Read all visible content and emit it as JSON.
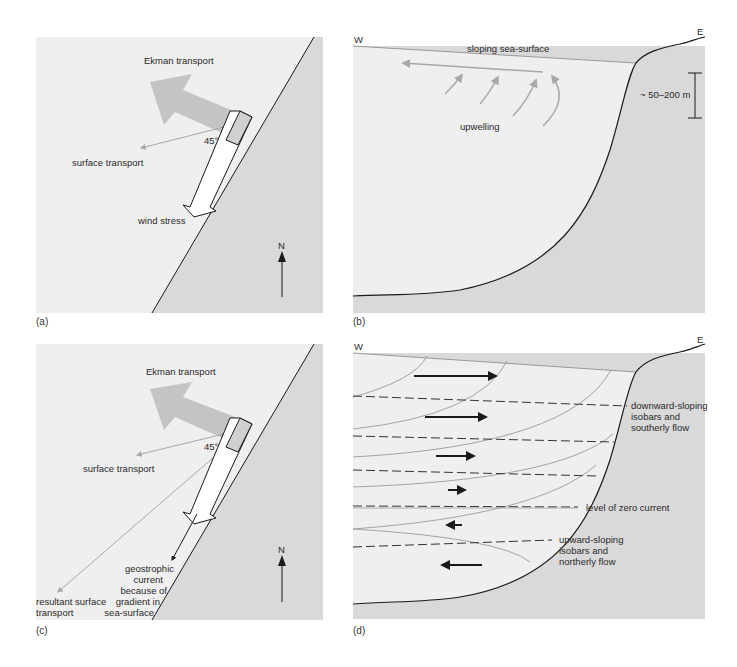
{
  "colors": {
    "sea": "#efefef",
    "land": "#d9d9d9",
    "ekman_arrow": "#c4c4c4",
    "thin_gray_arrow": "#a8a8a8",
    "line": "#1a1a1a",
    "isobar_curve": "#9a9a9a"
  },
  "panels": {
    "a": {
      "label": "(a)",
      "ekman_label": "Ekman transport",
      "surface_label": "surface transport",
      "angle_label": "45°",
      "wind_label": "wind stress",
      "north_label": "N"
    },
    "b": {
      "label": "(b)",
      "west_label": "W",
      "east_label": "E",
      "surface_label": "sloping sea-surface",
      "upwelling_label": "upwelling",
      "depth_label": "~ 50–200 m"
    },
    "c": {
      "label": "(c)",
      "ekman_label": "Ekman transport",
      "surface_label": "surface transport",
      "angle_label": "45°",
      "north_label": "N",
      "resultant_label_1": "resultant surface",
      "resultant_label_2": "transport",
      "geo_label_1": "geostrophic",
      "geo_label_2": "current",
      "geo_label_3": "because of",
      "geo_label_4": "gradient in",
      "geo_label_5": "sea-surface"
    },
    "d": {
      "label": "(d)",
      "west_label": "W",
      "east_label": "E",
      "down_label_1": "downward-sloping",
      "down_label_2": "isobars and",
      "down_label_3": "southerly flow",
      "zero_label": "level of zero current",
      "up_label_1": "upward-sloping",
      "up_label_2": "isobars and",
      "up_label_3": "northerly flow"
    }
  }
}
